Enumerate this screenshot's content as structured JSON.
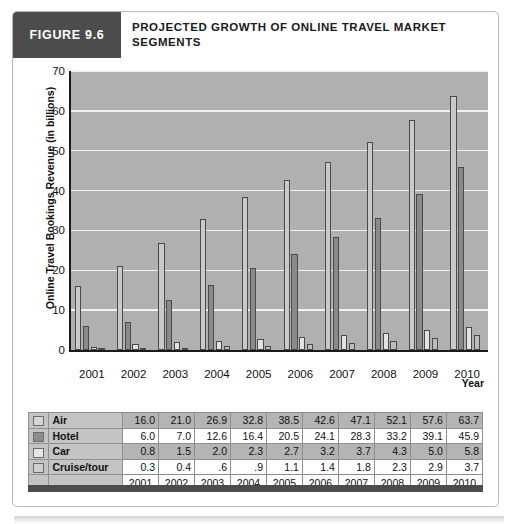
{
  "figure": {
    "number_label": "FIGURE 9.6",
    "title": "PROJECTED GROWTH OF ONLINE TRAVEL MARKET SEGMENTS"
  },
  "chart_data": {
    "type": "bar",
    "title": "PROJECTED GROWTH OF ONLINE TRAVEL MARKET SEGMENTS",
    "xlabel": "Year",
    "ylabel": "Online Travel Bookings Revenue (in billions)",
    "categories": [
      "2001",
      "2002",
      "2003",
      "2004",
      "2005",
      "2006",
      "2007",
      "2008",
      "2009",
      "2010"
    ],
    "yticks": [
      "0",
      "10",
      "20",
      "30",
      "40",
      "50",
      "60",
      "70"
    ],
    "ylim": [
      0,
      70
    ],
    "grid": true,
    "legend_position": "table",
    "series": [
      {
        "name": "Air",
        "color": "#c9c9c9",
        "values": [
          16.0,
          21.0,
          26.9,
          32.8,
          38.5,
          42.6,
          47.1,
          52.1,
          57.6,
          63.7
        ]
      },
      {
        "name": "Hotel",
        "color": "#8a8a8a",
        "values": [
          6.0,
          7.0,
          12.6,
          16.4,
          20.5,
          24.1,
          28.3,
          33.2,
          39.1,
          45.9
        ]
      },
      {
        "name": "Car",
        "color": "#e2e2e2",
        "values": [
          0.8,
          1.5,
          2.0,
          2.3,
          2.7,
          3.2,
          3.7,
          4.3,
          5.0,
          5.8
        ]
      },
      {
        "name": "Cruise/tour",
        "color": "#bdbdbd",
        "values": [
          0.3,
          0.4,
          0.6,
          0.9,
          1.1,
          1.4,
          1.8,
          2.3,
          2.9,
          3.7
        ]
      }
    ]
  },
  "table": {
    "year_header_row": [
      "2001",
      "2002",
      "2003",
      "2004",
      "2005",
      "2006",
      "2007",
      "2008",
      "2009",
      "2010"
    ],
    "rows": [
      {
        "label": "Air",
        "swatch": "air",
        "cells": [
          "16.0",
          "21.0",
          "26.9",
          "32.8",
          "38.5",
          "42.6",
          "47.1",
          "52.1",
          "57.6",
          "63.7"
        ]
      },
      {
        "label": "Hotel",
        "swatch": "hotel",
        "cells": [
          "6.0",
          "7.0",
          "12.6",
          "16.4",
          "20.5",
          "24.1",
          "28.3",
          "33.2",
          "39.1",
          "45.9"
        ]
      },
      {
        "label": "Car",
        "swatch": "car",
        "cells": [
          "0.8",
          "1.5",
          "2.0",
          "2.3",
          "2.7",
          "3.2",
          "3.7",
          "4.3",
          "5.0",
          "5.8"
        ]
      },
      {
        "label": "Cruise/tour",
        "swatch": "cruise",
        "cells": [
          "0.3",
          "0.4",
          ".6",
          ".9",
          "1.1",
          "1.4",
          "1.8",
          "2.3",
          "2.9",
          "3.7"
        ]
      }
    ]
  }
}
